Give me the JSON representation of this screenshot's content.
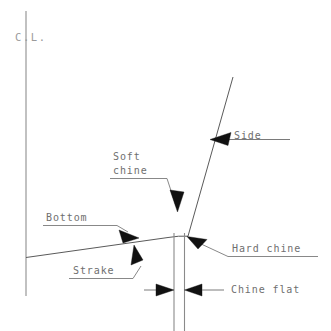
{
  "diagram": {
    "type": "technical-line-drawing",
    "background_color": "#ffffff",
    "line_color": "#5a5a5a",
    "text_color": "#6f6f6f",
    "arrow_color": "#111111",
    "centerline_label": "C.L.",
    "labels": {
      "side": "Side",
      "soft_chine_line1": "Soft",
      "soft_chine_line2": "chine",
      "bottom": "Bottom",
      "strake": "Strake",
      "hard_chine": "Hard chine",
      "chine_flat": "Chine flat"
    },
    "geometry": {
      "centerline_x": 26,
      "centerline_top_y": 11,
      "centerline_bottom_y": 296,
      "chine_corner_x": 188,
      "chine_corner_y": 236,
      "bottom_line_start_x": 26,
      "bottom_line_start_y": 257,
      "side_line_top_x": 233,
      "side_line_top_y": 77,
      "chine_flat_left_x": 174,
      "chine_flat_right_x": 184,
      "dimension_line_y": 290
    }
  }
}
